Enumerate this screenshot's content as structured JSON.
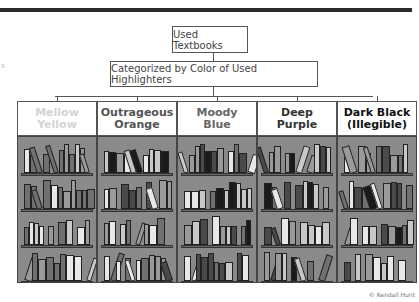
{
  "diagram": {
    "root": "Used Textbooks",
    "level2": "Categorized by Color of Used Highlighters",
    "categories": [
      {
        "label_line1": "Mellow",
        "label_line2": "Yellow",
        "text_color": "#d4d4d4"
      },
      {
        "label_line1": "Outrageous",
        "label_line2": "Orange",
        "text_color": "#555555"
      },
      {
        "label_line1": "Moody",
        "label_line2": "Blue",
        "text_color": "#666666"
      },
      {
        "label_line1": "Deep",
        "label_line2": "Purple",
        "text_color": "#333333"
      },
      {
        "label_line1": "Dark Black",
        "label_line2": "(Illegible)",
        "text_color": "#111111"
      }
    ],
    "credit": "© Kendall Hunt",
    "margin_mark": "s",
    "colors": {
      "top_bar": "#2a2a2a",
      "shelf_bg": "#8a8a8a",
      "book_shades": [
        "#e8e8e8",
        "#c8c8c8",
        "#9a9a9a",
        "#707070",
        "#4a4a4a",
        "#1a1a1a"
      ]
    }
  }
}
